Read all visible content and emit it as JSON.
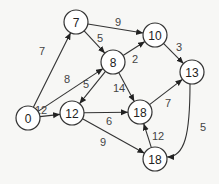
{
  "diagram": {
    "type": "directed-weighted-graph",
    "nodes": [
      {
        "id": "n0",
        "label": "0",
        "x": 28,
        "y": 118
      },
      {
        "id": "n7",
        "label": "7",
        "x": 76,
        "y": 22
      },
      {
        "id": "n8",
        "label": "8",
        "x": 113,
        "y": 62
      },
      {
        "id": "n10",
        "label": "10",
        "x": 155,
        "y": 35
      },
      {
        "id": "n13",
        "label": "13",
        "x": 192,
        "y": 72
      },
      {
        "id": "n12",
        "label": "12",
        "x": 72,
        "y": 113
      },
      {
        "id": "n18a",
        "label": "18",
        "x": 140,
        "y": 112
      },
      {
        "id": "n18b",
        "label": "18",
        "x": 155,
        "y": 159
      }
    ],
    "edges": [
      {
        "from": "n0",
        "to": "n7",
        "weight": "7",
        "lx": 42,
        "ly": 51
      },
      {
        "from": "n0",
        "to": "n8",
        "weight": "8",
        "lx": 67,
        "ly": 79
      },
      {
        "from": "n0",
        "to": "n12",
        "weight": "12",
        "lx": 41,
        "ly": 110
      },
      {
        "from": "n7",
        "to": "n8",
        "weight": "5",
        "lx": 100,
        "ly": 38
      },
      {
        "from": "n7",
        "to": "n10",
        "weight": "9",
        "lx": 118,
        "ly": 22
      },
      {
        "from": "n8",
        "to": "n10",
        "weight": "2",
        "lx": 135,
        "ly": 59
      },
      {
        "from": "n8",
        "to": "n12",
        "weight": "5",
        "lx": 86,
        "ly": 84
      },
      {
        "from": "n8",
        "to": "n18a",
        "weight": "14",
        "lx": 119,
        "ly": 88
      },
      {
        "from": "n10",
        "to": "n13",
        "weight": "3",
        "lx": 179,
        "ly": 47
      },
      {
        "from": "n12",
        "to": "n18a",
        "weight": "6",
        "lx": 109,
        "ly": 121
      },
      {
        "from": "n12",
        "to": "n18b",
        "weight": "9",
        "lx": 103,
        "ly": 142
      },
      {
        "from": "n18a",
        "to": "n13",
        "weight": "7",
        "lx": 168,
        "ly": 103
      },
      {
        "from": "n13",
        "to": "n18b",
        "weight": "5",
        "lx": 203,
        "ly": 127
      },
      {
        "from": "n18b",
        "to": "n18a",
        "weight": "12",
        "lx": 158,
        "ly": 136
      }
    ]
  }
}
